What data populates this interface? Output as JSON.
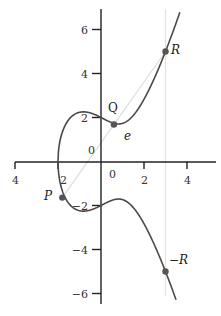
{
  "chart_data": {
    "type": "line",
    "title": "",
    "subtitle": "",
    "xlabel": "",
    "ylabel": "",
    "equation": "y^2 = x^3 - 2x + 4",
    "curve": {
      "a": -2,
      "b": 4,
      "x_min": -2,
      "x_max_upper": 3.67,
      "x_max_lower": 3.49
    },
    "xlim": [
      -4,
      5
    ],
    "ylim": [
      -6.5,
      6.8
    ],
    "grid": false,
    "x_ticks": [
      {
        "value": -4,
        "label": "4"
      },
      {
        "value": -2,
        "label": "2"
      },
      {
        "value": 0,
        "label": "0"
      },
      {
        "value": 2,
        "label": "2"
      },
      {
        "value": 4,
        "label": "4"
      }
    ],
    "y_ticks": [
      {
        "value": 6,
        "label": "6"
      },
      {
        "value": 4,
        "label": "4"
      },
      {
        "value": 2,
        "label": "2"
      },
      {
        "value": 0,
        "label": "0"
      },
      {
        "value": -2,
        "label": "−2"
      },
      {
        "value": -4,
        "label": "−4"
      },
      {
        "value": -6,
        "label": "−6"
      }
    ],
    "points": [
      {
        "name": "P",
        "x": -1.8,
        "y": -1.64,
        "label": "P"
      },
      {
        "name": "Q",
        "x": 0.6,
        "y": 1.68,
        "label": "Q"
      },
      {
        "name": "R",
        "x": 3.0,
        "y": 5.0,
        "label": "R"
      },
      {
        "name": "-R",
        "x": 3.0,
        "y": -5.0,
        "label": "−R"
      }
    ],
    "annotations": [
      {
        "text": "e",
        "x": 1.2,
        "y": 1.2,
        "style": "italic"
      }
    ],
    "secant_line": {
      "from": "P",
      "through": "Q",
      "to": "R",
      "color": "#d8d8d8"
    },
    "vertical_line": {
      "x": 3.0,
      "color": "#e0e0e0"
    },
    "colors": {
      "curve": "#4a4a4a",
      "axis": "#222222",
      "point": "#555555"
    }
  }
}
